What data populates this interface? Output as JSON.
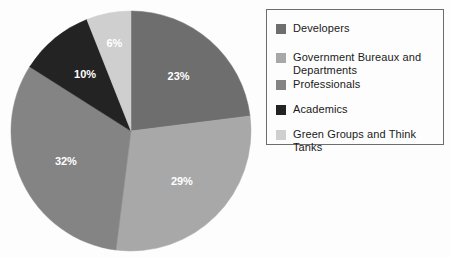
{
  "chart_data": {
    "type": "pie",
    "title": "",
    "legend_position": "right",
    "labels": [
      "Developers",
      "Government Bureaux and Departments",
      "Professionals",
      "Academics",
      "Green Groups and Think Tanks"
    ],
    "values": [
      23,
      29,
      32,
      10,
      6
    ],
    "value_labels": [
      "23%",
      "29%",
      "32%",
      "10%",
      "6%"
    ],
    "colors": [
      "#6e6e6e",
      "#a8a8a8",
      "#848484",
      "#232323",
      "#cfcfcf"
    ],
    "units": "percent",
    "start_angle_deg": 0,
    "direction": "clockwise"
  },
  "pie": {
    "slices": [
      {
        "label": "Developers",
        "value": 23,
        "value_label": "23%",
        "color": "#6e6e6e",
        "label_color": "#ffffff"
      },
      {
        "label": "Government Bureaux and Departments",
        "value": 29,
        "value_label": "29%",
        "color": "#a8a8a8",
        "label_color": "#ffffff"
      },
      {
        "label": "Professionals",
        "value": 32,
        "value_label": "32%",
        "color": "#848484",
        "label_color": "#ffffff"
      },
      {
        "label": "Academics",
        "value": 10,
        "value_label": "10%",
        "color": "#232323",
        "label_color": "#ffffff"
      },
      {
        "label": "Green Groups and Think Tanks",
        "value": 6,
        "value_label": "6%",
        "color": "#cfcfcf",
        "label_color": "#3a3a3a"
      }
    ],
    "center_x": 131,
    "center_y": 131,
    "radius": 120
  },
  "legend": {
    "border_color": "#6d6d6d",
    "items": [
      {
        "label": "Developers",
        "color": "#6e6e6e",
        "y": 12
      },
      {
        "label": "Government Bureaux and\nDepartments",
        "color": "#a8a8a8",
        "y": 41
      },
      {
        "label": "Professionals",
        "color": "#848484",
        "y": 68
      },
      {
        "label": "Academics",
        "color": "#232323",
        "y": 93
      },
      {
        "label": "Green Groups and Think Tanks",
        "color": "#cfcfcf",
        "y": 118
      }
    ]
  }
}
